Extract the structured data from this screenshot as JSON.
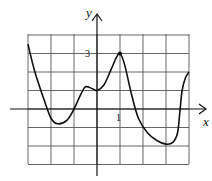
{
  "chart_data": {
    "type": "line",
    "title": "",
    "xlabel": "x",
    "ylabel": "y",
    "xlim": [
      -3,
      4
    ],
    "ylim": [
      -3,
      4
    ],
    "grid": true,
    "tick_labels": {
      "x": [
        "1"
      ],
      "y": [
        "3"
      ]
    },
    "series": [
      {
        "name": "f(x)",
        "x": [
          -3,
          -2.7,
          -2.3,
          -2,
          -1.7,
          -1.3,
          -1,
          -0.7,
          -0.5,
          -0.2,
          0,
          0.3,
          0.6,
          0.85,
          1,
          1.2,
          1.5,
          1.8,
          2.2,
          2.6,
          3,
          3.3,
          3.5,
          3.6,
          3.7,
          3.85,
          4
        ],
        "y": [
          3.5,
          2.0,
          0.5,
          -0.5,
          -0.8,
          -0.6,
          0.0,
          0.8,
          1.2,
          1.1,
          1.0,
          1.3,
          2.1,
          2.8,
          3.0,
          2.4,
          0.8,
          -0.5,
          -1.3,
          -1.7,
          -1.9,
          -1.8,
          -1.3,
          -0.2,
          1.0,
          1.7,
          2.0
        ]
      }
    ],
    "annotations": [
      {
        "type": "point",
        "x": 1,
        "y": 3
      }
    ]
  },
  "labels": {
    "x_axis": "x",
    "y_axis": "y",
    "x_tick": "1",
    "y_tick": "3"
  }
}
